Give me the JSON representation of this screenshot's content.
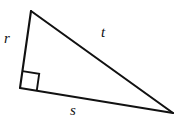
{
  "figure": {
    "kind": "right-triangle-diagram",
    "background_color": "#ffffff",
    "stroke_color": "#111111",
    "width": 181,
    "height": 126
  },
  "labels": {
    "leg_vertical": "r",
    "hypotenuse": "t",
    "leg_horizontal": "s"
  },
  "geometry": {
    "vertices": {
      "apex": {
        "x": 31,
        "y": 11
      },
      "right_angle": {
        "x": 20,
        "y": 88
      },
      "far_right": {
        "x": 173,
        "y": 113
      }
    },
    "right_angle_marker": {
      "size": 17,
      "at_vertex": "right_angle"
    },
    "edges": [
      {
        "name": "r",
        "from": "apex",
        "to": "right_angle"
      },
      {
        "name": "t",
        "from": "apex",
        "to": "far_right"
      },
      {
        "name": "s",
        "from": "right_angle",
        "to": "far_right"
      }
    ]
  }
}
